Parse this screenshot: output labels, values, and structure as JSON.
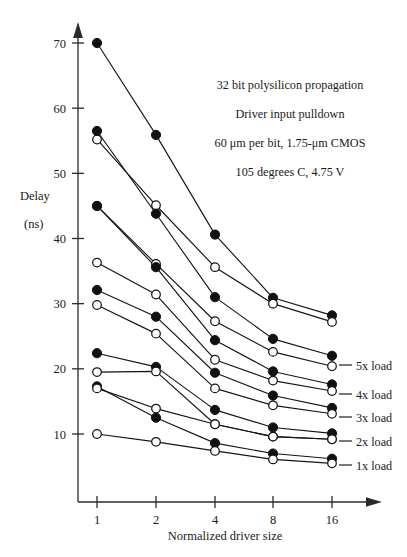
{
  "chart_data": {
    "type": "line",
    "title": "",
    "xlabel": "Normalized driver size",
    "ylabel": "Delay",
    "ylabel_units": "(ns)",
    "x": [
      1,
      2,
      4,
      8,
      16
    ],
    "xtick_labels": [
      "1",
      "2",
      "4",
      "8",
      "16"
    ],
    "xscale": "log2-categorical",
    "ytick_labels": [
      "10",
      "20",
      "30",
      "40",
      "50",
      "60",
      "70"
    ],
    "yticks": [
      10,
      20,
      30,
      40,
      50,
      60,
      70
    ],
    "ylim": [
      3,
      73
    ],
    "grid": false,
    "legend_position": "right-of-plot",
    "marker_note": "each load has a filled-circle series and an open-circle series",
    "series": [
      {
        "name": "5x load",
        "marker": "filled-circle",
        "values": [
          70.0,
          55.9,
          40.6,
          30.9,
          28.2
        ]
      },
      {
        "name": "5x load",
        "marker": "open-circle",
        "values": [
          55.2,
          45.1,
          35.6,
          30.0,
          27.2
        ]
      },
      {
        "name": "4x load",
        "marker": "filled-circle",
        "values": [
          56.5,
          43.8,
          31.0,
          24.6,
          22.0
        ]
      },
      {
        "name": "4x load",
        "marker": "open-circle",
        "values": [
          45.0,
          36.1,
          27.3,
          22.6,
          20.4
        ]
      },
      {
        "name": "3x load",
        "marker": "filled-circle",
        "values": [
          45.0,
          35.6,
          24.4,
          19.6,
          17.6
        ]
      },
      {
        "name": "3x load",
        "marker": "open-circle",
        "values": [
          36.3,
          31.4,
          21.4,
          18.2,
          16.6
        ]
      },
      {
        "name": "2x load",
        "marker": "filled-circle",
        "values": [
          32.1,
          28.0,
          19.4,
          15.9,
          14.0
        ]
      },
      {
        "name": "2x load",
        "marker": "open-circle",
        "values": [
          29.8,
          25.4,
          17.0,
          14.4,
          13.1
        ]
      },
      {
        "name": "1x load",
        "marker": "filled-circle",
        "values": [
          22.4,
          20.3,
          13.7,
          11.0,
          10.1
        ]
      },
      {
        "name": "1x load",
        "marker": "open-circle",
        "values": [
          19.5,
          19.6,
          11.5,
          9.6,
          9.2
        ]
      },
      {
        "name": "extra-a",
        "marker": "filled-circle",
        "values": [
          17.3,
          12.5,
          8.6,
          7.0,
          6.2
        ]
      },
      {
        "name": "extra-a",
        "marker": "open-circle",
        "values": [
          17.0,
          13.9,
          11.5,
          9.6,
          9.2
        ]
      },
      {
        "name": "extra-b",
        "marker": "open-circle",
        "values": [
          10.0,
          8.8,
          7.4,
          6.1,
          5.5
        ]
      }
    ],
    "annotations": [
      "32 bit polysilicon propagation",
      "Driver input pulldown",
      "60 μm per bit, 1.75-μm CMOS",
      "105 degrees C, 4.75 V"
    ],
    "legend_entries": [
      "5x load",
      "4x load",
      "3x load",
      "2x load",
      "1x load"
    ]
  },
  "axis": {
    "y_title_line1": "Delay",
    "y_title_line2": "(ns)",
    "x_title": "Normalized driver size"
  },
  "colors": {
    "ink": "#141414",
    "axis": "#2b2b2b",
    "background": "#ffffff",
    "marker_open_fill": "#ffffff"
  }
}
